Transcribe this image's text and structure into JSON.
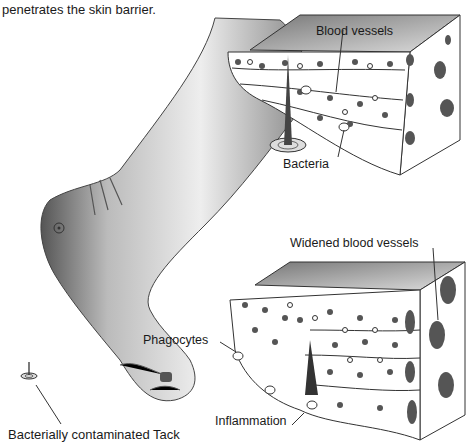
{
  "caption": "penetrates the skin barrier.",
  "labels": {
    "blood_vessels": "Blood vessels",
    "bacteria": "Bacteria",
    "widened_blood_vessels": "Widened blood vessels",
    "phagocytes": "Phagocytes",
    "inflammation": "Inflammation",
    "tack": "Bacterially contaminated Tack"
  },
  "colors": {
    "ink": "#1a1a1a",
    "shade": "#6e6e6e",
    "light_shade": "#bdbdbd",
    "cell_dark": "#555555"
  }
}
